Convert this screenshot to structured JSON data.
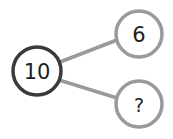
{
  "diagram": {
    "type": "number-bond",
    "whole": {
      "label": "10",
      "cx": 37,
      "cy": 71,
      "r": 24,
      "stroke": "#3a3a3a"
    },
    "parts": [
      {
        "label": "6",
        "cx": 139,
        "cy": 34,
        "r": 23,
        "stroke": "#9a9a9a"
      },
      {
        "label": "?",
        "cx": 139,
        "cy": 104,
        "r": 23,
        "stroke": "#9a9a9a"
      }
    ],
    "connector_color": "#9a9a9a"
  }
}
